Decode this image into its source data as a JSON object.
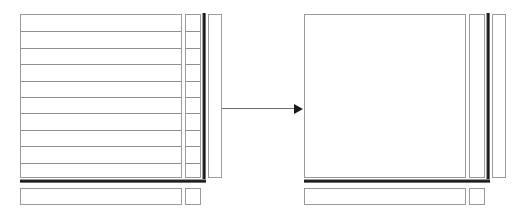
{
  "diagram": {
    "type": "before-after-schematic",
    "colors": {
      "outline": "#9a9a9a",
      "row_rule": "#8f8f8f",
      "thick_rule": "#111111",
      "arrow": "#1a1a1a",
      "background": "#ffffff"
    },
    "arrow": {
      "name": "transformation-arrow",
      "direction": "left-to-right",
      "x": 222,
      "y": 109,
      "length": 83
    },
    "panels": [
      {
        "id": "before",
        "label": "",
        "origin_x": 0,
        "grid_block": {
          "x": 20,
          "y": 14,
          "width": 162,
          "height": 164,
          "row_count": 10,
          "row_spacing": 16.4,
          "rows_visible": true
        },
        "side_column": {
          "x": 185,
          "y": 14,
          "width": 16,
          "height": 164,
          "row_count": 10,
          "rows_visible": true
        },
        "thick_rule_vertical": {
          "x": 202,
          "y": 13,
          "height": 170
        },
        "thick_rule_horizontal": {
          "x": 20,
          "y": 179,
          "width": 186
        },
        "tall_rect": {
          "x": 208,
          "y": 14,
          "width": 14,
          "height": 164
        },
        "bottom_strip": {
          "x": 20,
          "y": 188,
          "width": 162,
          "height": 17
        },
        "bottom_square": {
          "x": 185,
          "y": 188,
          "width": 16,
          "height": 17
        }
      },
      {
        "id": "after",
        "label": "",
        "origin_x": 290,
        "grid_block": {
          "x": 14,
          "y": 14,
          "width": 162,
          "height": 164,
          "row_count": 0,
          "row_spacing": 0,
          "rows_visible": false
        },
        "side_column": {
          "x": 179,
          "y": 14,
          "width": 16,
          "height": 164,
          "row_count": 0,
          "rows_visible": false
        },
        "thick_rule_vertical": {
          "x": 196,
          "y": 13,
          "height": 170
        },
        "thick_rule_horizontal": {
          "x": 14,
          "y": 179,
          "width": 186
        },
        "tall_rect": {
          "x": 202,
          "y": 14,
          "width": 14,
          "height": 164
        },
        "bottom_strip": {
          "x": 14,
          "y": 188,
          "width": 162,
          "height": 17
        },
        "bottom_square": {
          "x": 179,
          "y": 188,
          "width": 16,
          "height": 17
        }
      }
    ]
  }
}
